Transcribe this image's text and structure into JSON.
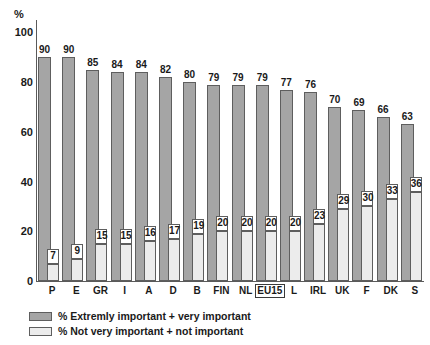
{
  "chart_data": {
    "type": "bar",
    "title": "",
    "subtitle": "",
    "xlabel": "",
    "ylabel": "%",
    "ylim": [
      0,
      105
    ],
    "yticks": [
      0,
      20,
      40,
      60,
      80,
      100
    ],
    "grid": false,
    "legend_position": "bottom-left",
    "categories": [
      "P",
      "E",
      "GR",
      "I",
      "A",
      "D",
      "B",
      "FIN",
      "NL",
      "EU15",
      "L",
      "IRL",
      "UK",
      "F",
      "DK",
      "S"
    ],
    "highlighted_category": "EU15",
    "series": [
      {
        "name": "% Extremly important + very important",
        "color": "#a5a5a5",
        "values": [
          90,
          90,
          85,
          84,
          84,
          82,
          80,
          79,
          79,
          79,
          77,
          76,
          70,
          69,
          66,
          63
        ]
      },
      {
        "name": "% Not very important + not important",
        "color": "#ececec",
        "values": [
          7,
          9,
          15,
          15,
          16,
          17,
          19,
          20,
          20,
          20,
          20,
          23,
          29,
          30,
          33,
          36
        ]
      }
    ]
  },
  "axis": {
    "y_unit": "%",
    "y_tick_labels": [
      "0",
      "20",
      "40",
      "60",
      "80",
      "100"
    ]
  },
  "legend": {
    "items": [
      {
        "label": "% Extremly important + very important",
        "swatch": "dark"
      },
      {
        "label": "% Not very important + not important",
        "swatch": "light"
      }
    ]
  }
}
